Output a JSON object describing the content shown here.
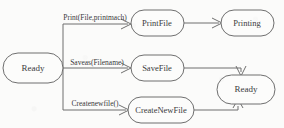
{
  "diagram": {
    "type": "state-transition-diagram",
    "background_color": "#fbfbfa",
    "stroke_color": "#6f6f6f",
    "text_color": "#3b3b3b",
    "nodes": [
      {
        "id": "ready-start",
        "label": "Ready",
        "x": 33,
        "y": 68,
        "rx": 30,
        "ry": 15
      },
      {
        "id": "printfile",
        "label": "PrintFile",
        "x": 158,
        "y": 23,
        "rx": 26,
        "ry": 13
      },
      {
        "id": "printing",
        "label": "Printing",
        "x": 247,
        "y": 23,
        "rx": 26,
        "ry": 13
      },
      {
        "id": "savefile",
        "label": "SaveFile",
        "x": 158,
        "y": 68,
        "rx": 26,
        "ry": 13
      },
      {
        "id": "createnewfile",
        "label": "CreateNewFile",
        "x": 161,
        "y": 110,
        "rx": 33,
        "ry": 13
      },
      {
        "id": "ready-end",
        "label": "Ready",
        "x": 246,
        "y": 89,
        "rx": 29,
        "ry": 14
      }
    ],
    "edges": [
      {
        "id": "edge-print",
        "from": "ready-start",
        "to": "printfile",
        "label": "Print(File,printmach)",
        "label_x": 95,
        "label_y": 18
      },
      {
        "id": "edge-saveas",
        "from": "ready-start",
        "to": "savefile",
        "label": "Saveas(Filename)",
        "label_x": 97,
        "label_y": 64
      },
      {
        "id": "edge-createnewfile",
        "from": "ready-start",
        "to": "createnewfile",
        "label": "Createnewfile()",
        "label_x": 95,
        "label_y": 104
      },
      {
        "id": "edge-printfile-printing",
        "from": "printfile",
        "to": "printing",
        "label": ""
      },
      {
        "id": "edge-savefile-ready",
        "from": "savefile",
        "to": "ready-end",
        "label": ""
      },
      {
        "id": "edge-createnewfile-ready",
        "from": "createnewfile",
        "to": "ready-end",
        "label": ""
      }
    ]
  }
}
